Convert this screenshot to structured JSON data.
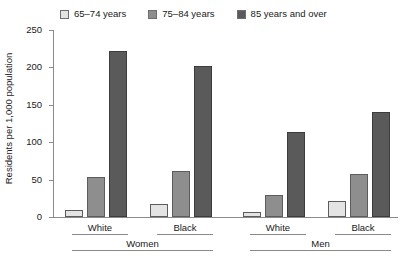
{
  "chart_data": {
    "type": "bar",
    "title": "",
    "xlabel": "",
    "ylabel": "Residents per 1,000 population",
    "ylim": [
      0,
      250
    ],
    "yticks": [
      0,
      50,
      100,
      150,
      200,
      250
    ],
    "ytick_labels": [
      "0",
      "50",
      "100",
      "150",
      "200",
      "250"
    ],
    "grid": false,
    "legend_position": "top",
    "categories": [
      "White",
      "Black",
      "White",
      "Black"
    ],
    "group_labels": [
      "Women",
      "Men"
    ],
    "groups": [
      {
        "label": "Women",
        "categories": [
          {
            "label": "White",
            "values": [
              10,
              53,
              222
            ]
          },
          {
            "label": "Black",
            "values": [
              18,
              62,
              202
            ]
          }
        ]
      },
      {
        "label": "Men",
        "categories": [
          {
            "label": "White",
            "values": [
              7,
              30,
              113
            ]
          },
          {
            "label": "Black",
            "values": [
              21,
              57,
              141
            ]
          }
        ]
      }
    ],
    "series": [
      {
        "name": "65–74 years",
        "color": "#e4e4e4",
        "values": [
          10,
          18,
          7,
          21
        ]
      },
      {
        "name": "75–84 years",
        "color": "#8e8e8e",
        "values": [
          53,
          62,
          30,
          57
        ]
      },
      {
        "name": "85 years and over",
        "color": "#5a5a5a",
        "values": [
          222,
          202,
          113,
          141
        ]
      }
    ]
  },
  "legend": {
    "items": [
      {
        "label": "65–74 years",
        "color": "#e4e4e4"
      },
      {
        "label": "75–84 years",
        "color": "#8e8e8e"
      },
      {
        "label": "85 years and over",
        "color": "#5a5a5a"
      }
    ]
  },
  "axis": {
    "y_title": "Residents per 1,000 population",
    "y_tick_labels": [
      "250",
      "200",
      "150",
      "100",
      "50",
      "0"
    ]
  },
  "x_axis": {
    "sub_labels": [
      "White",
      "Black",
      "White",
      "Black"
    ],
    "group_labels": [
      "Women",
      "Men"
    ]
  }
}
